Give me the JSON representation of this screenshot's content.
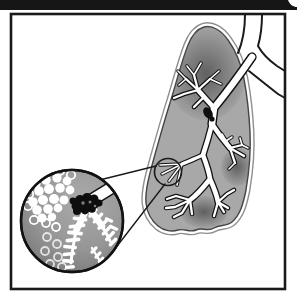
{
  "illustration": {
    "type": "grayscale-medical-diagram",
    "visible_text": "",
    "parts": [
      "header-bar",
      "frame",
      "lung",
      "trachea",
      "bronchial-tree",
      "airway-blockage",
      "magnifier-callout",
      "bronchiole-inset",
      "alveoli-cluster",
      "tumor-mass",
      "airway-feathers"
    ]
  },
  "colors": {
    "bar": "#161616",
    "bg": "#ffffff",
    "paper": "#ffffff",
    "frame": "#1a1a1a",
    "lung_fill": "#a8a8a8",
    "lung_edge": "#454545",
    "lung_outer": "#8f8f8f",
    "shade": "#585858",
    "line": "#1a1a1a",
    "airway_outline": "#121212",
    "airway_fill": "#ffffff",
    "tumor": "#0e0e0e",
    "tumor_fleck": "#7d7d7d",
    "inset_ring": "#121212",
    "inset_light": "#ababab",
    "inset_mid": "#969696",
    "inset_dark": "#686868",
    "alveoli": "#ffffff"
  }
}
